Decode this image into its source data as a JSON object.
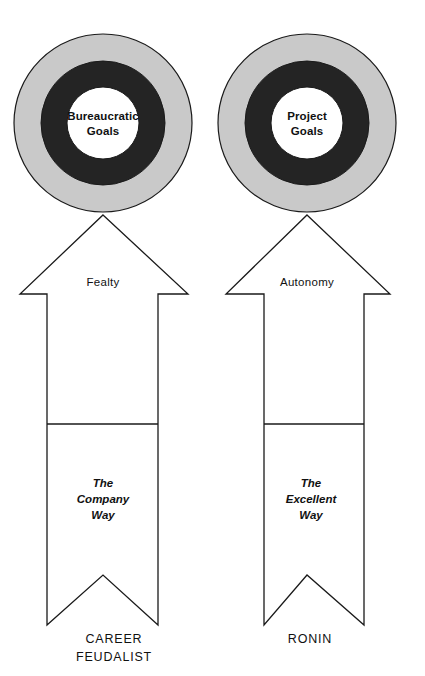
{
  "diagram": {
    "type": "comparison-diagram",
    "background_color": "#ffffff",
    "ink_color": "#1a1a1a",
    "ring_outer_color": "#c9c9c9",
    "ring_middle_color": "#242424",
    "ring_inner_color": "#ffffff",
    "columns": [
      {
        "id": "career-feudalist",
        "target": {
          "center_label_line1": "Bureaucratic",
          "center_label_line2": "Goals"
        },
        "arrow_label": "Fealty",
        "ribbon_label_line1": "The",
        "ribbon_label_line2": "Company",
        "ribbon_label_line3": "Way",
        "caption_line1": "CAREER",
        "caption_line2": "FEUDALIST"
      },
      {
        "id": "ronin",
        "target": {
          "center_label_line1": "Project",
          "center_label_line2": "Goals"
        },
        "arrow_label": "Autonomy",
        "ribbon_label_line1": "The",
        "ribbon_label_line2": "Excellent",
        "ribbon_label_line3": "Way",
        "caption_line1": "RONIN",
        "caption_line2": ""
      }
    ]
  }
}
